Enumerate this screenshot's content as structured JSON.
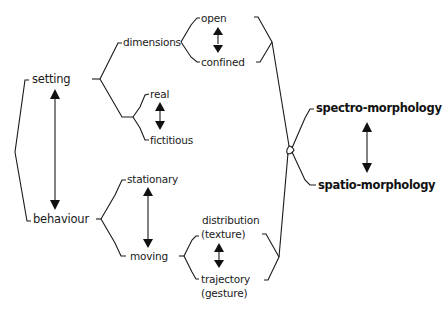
{
  "diagram": {
    "title": "",
    "nodes": {
      "setting": "setting",
      "behaviour": "behaviour",
      "dimensions": "dimensions",
      "open": "open",
      "confined": "confined",
      "real": "real",
      "fictitious": "fictitious",
      "stationary": "stationary",
      "moving": "moving",
      "distribution": "distribution",
      "texture": "(texture)",
      "trajectory": "trajectory",
      "gesture": "(gesture)",
      "spectro": "spectro-morphology",
      "spatio": "spatio-morphology"
    },
    "relations": [
      {
        "from": "setting",
        "to": "behaviour",
        "type": "bidirectional"
      },
      {
        "from": "open",
        "to": "confined",
        "type": "bidirectional"
      },
      {
        "from": "real",
        "to": "fictitious",
        "type": "bidirectional"
      },
      {
        "from": "stationary",
        "to": "moving",
        "type": "bidirectional"
      },
      {
        "from": "distribution (texture)",
        "to": "trajectory (gesture)",
        "type": "bidirectional"
      },
      {
        "from": "spectro-morphology",
        "to": "spatio-morphology",
        "type": "bidirectional"
      }
    ],
    "tree": {
      "setting": {
        "dimensions": [
          "open",
          "confined"
        ],
        "reality": [
          "real",
          "fictitious"
        ]
      },
      "behaviour": {
        "stationary": [],
        "moving": [
          "distribution (texture)",
          "trajectory (gesture)"
        ]
      },
      "links_to": [
        "spectro-morphology",
        "spatio-morphology"
      ]
    }
  }
}
